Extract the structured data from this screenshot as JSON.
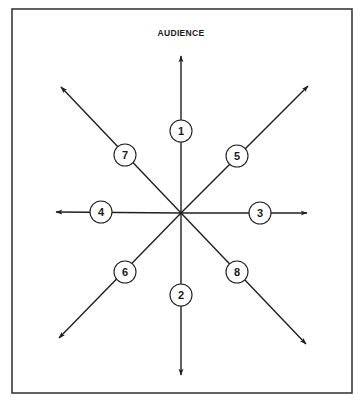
{
  "diagram": {
    "title": "AUDIENCE",
    "frame": {
      "x": 12,
      "y": 9,
      "width": 340,
      "height": 384
    },
    "center": {
      "x": 181,
      "y": 213
    },
    "node_radius": 11,
    "colors": {
      "stroke": "#1f1f1f",
      "background": "#ffffff",
      "border": "#3a3a3a"
    },
    "rays": [
      {
        "label": "1",
        "direction": "up",
        "tip": {
          "x": 181,
          "y": 56
        },
        "node": {
          "x": 181,
          "y": 131
        }
      },
      {
        "label": "2",
        "direction": "down",
        "tip": {
          "x": 181,
          "y": 375
        },
        "node": {
          "x": 181,
          "y": 295
        }
      },
      {
        "label": "3",
        "direction": "right",
        "tip": {
          "x": 307,
          "y": 213
        },
        "node": {
          "x": 260,
          "y": 213
        }
      },
      {
        "label": "4",
        "direction": "left",
        "tip": {
          "x": 56,
          "y": 212
        },
        "node": {
          "x": 101,
          "y": 212
        }
      },
      {
        "label": "5",
        "direction": "up-right",
        "tip": {
          "x": 308,
          "y": 86
        },
        "node": {
          "x": 237,
          "y": 156
        }
      },
      {
        "label": "6",
        "direction": "down-left",
        "tip": {
          "x": 59,
          "y": 338
        },
        "node": {
          "x": 125,
          "y": 272
        }
      },
      {
        "label": "7",
        "direction": "up-left",
        "tip": {
          "x": 61,
          "y": 87
        },
        "node": {
          "x": 125,
          "y": 155
        }
      },
      {
        "label": "8",
        "direction": "down-right",
        "tip": {
          "x": 306,
          "y": 344
        },
        "node": {
          "x": 237,
          "y": 272
        }
      }
    ]
  }
}
